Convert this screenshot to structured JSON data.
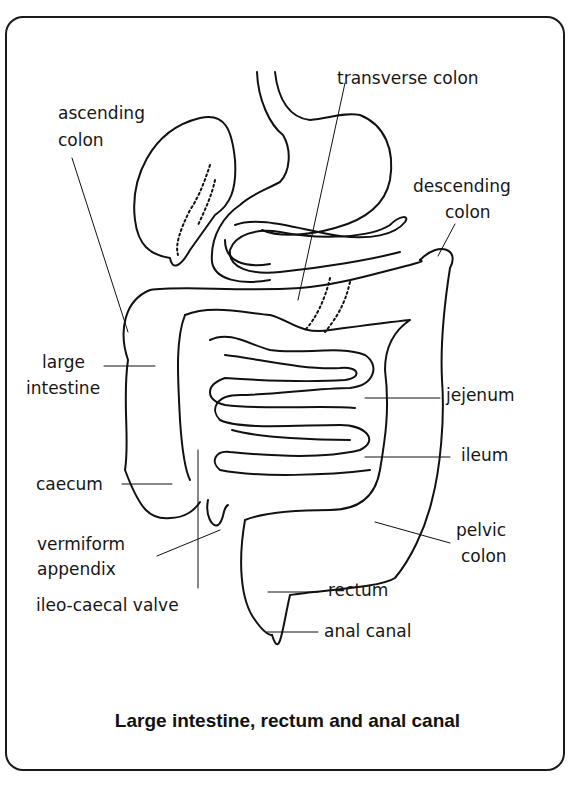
{
  "figure": {
    "caption": "Large intestine, rectum and anal canal",
    "labels": {
      "transverse_colon": "transverse colon",
      "ascending_colon_1": "ascending",
      "ascending_colon_2": "colon",
      "descending_colon_1": "descending",
      "descending_colon_2": "colon",
      "large_intestine_1": "large",
      "large_intestine_2": "intestine",
      "jejenum": "jejenum",
      "ileum": "ileum",
      "caecum": "caecum",
      "pelvic_colon_1": "pelvic",
      "pelvic_colon_2": "colon",
      "vermiform_appendix_1": "vermiform",
      "vermiform_appendix_2": "appendix",
      "rectum": "rectum",
      "ileo_caecal_valve": "ileo-caecal valve",
      "anal_canal": "anal canal"
    }
  }
}
